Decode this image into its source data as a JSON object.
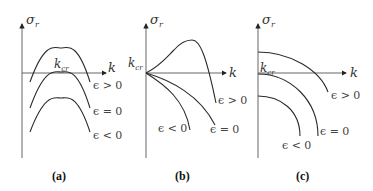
{
  "figure": {
    "panels": [
      {
        "id": "a",
        "caption": "(a)",
        "y_axis_label": "σ",
        "y_axis_subscript": "r",
        "x_axis_label": "k",
        "kcr_label": "k",
        "kcr_subscript": "cr",
        "curves": [
          {
            "label": "ϵ > 0",
            "shape": "hump crossing axis"
          },
          {
            "label": "ϵ = 0",
            "shape": "hump touching axis at k_cr"
          },
          {
            "label": "ϵ < 0",
            "shape": "hump below axis"
          }
        ]
      },
      {
        "id": "b",
        "caption": "(b)",
        "y_axis_label": "σ",
        "y_axis_subscript": "r",
        "x_axis_label": "k",
        "kcr_label": "k",
        "kcr_subscript": "cr",
        "curves": [
          {
            "label": "ϵ > 0",
            "shape": "rises from origin then falls"
          },
          {
            "label": "ϵ = 0",
            "shape": "decreasing from origin"
          },
          {
            "label": "ϵ < 0",
            "shape": "steeply decreasing from origin"
          }
        ]
      },
      {
        "id": "c",
        "caption": "(c)",
        "y_axis_label": "σ",
        "y_axis_subscript": "r",
        "x_axis_label": "k",
        "kcr_label": "k",
        "kcr_subscript": "cr",
        "curves": [
          {
            "label": "ϵ > 0",
            "shape": "quarter-arc starting above axis"
          },
          {
            "label": "ϵ = 0",
            "shape": "quarter-arc starting at origin"
          },
          {
            "label": "ϵ < 0",
            "shape": "quarter-arc starting below axis"
          }
        ]
      }
    ]
  }
}
